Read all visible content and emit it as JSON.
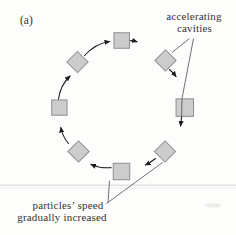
{
  "figure": {
    "panel_label": "(a)",
    "caption_top_right": {
      "line1": "accelerating",
      "line2": "cavities"
    },
    "caption_bottom_left": {
      "line1": "particles’ speed",
      "line2": "gradually increased"
    },
    "colors": {
      "background": "#fdfdfc",
      "cavity_fill": "#cccccc",
      "cavity_border": "#8e8e8e",
      "arrow": "#1c1c1c",
      "pointer": "#4d4d4d",
      "text": "#333333",
      "scan_rule": "#e4e4e4",
      "scan_rule_light": "#f1f1f0",
      "smudge": "#ececea"
    },
    "cavities": [
      {
        "name": "cavity-top",
        "cx": 121.7,
        "cy": 40.5,
        "size": 15.5,
        "rot": 0
      },
      {
        "name": "cavity-top-right",
        "cx": 165.5,
        "cy": 60.5,
        "size": 15,
        "rot": 45
      },
      {
        "name": "cavity-right",
        "cx": 184.8,
        "cy": 107.6,
        "size": 17.5,
        "rot": 0
      },
      {
        "name": "cavity-bottom-right",
        "cx": 165,
        "cy": 151.5,
        "size": 15,
        "rot": 45
      },
      {
        "name": "cavity-bottom",
        "cx": 121.5,
        "cy": 171.5,
        "size": 16.5,
        "rot": 0
      },
      {
        "name": "cavity-bottom-left",
        "cx": 78.5,
        "cy": 151.5,
        "size": 15,
        "rot": 45
      },
      {
        "name": "cavity-left",
        "cx": 59.4,
        "cy": 107.6,
        "size": 15.3,
        "rot": 0
      },
      {
        "name": "cavity-top-left",
        "cx": 77.5,
        "cy": 62,
        "size": 15,
        "rot": 45
      }
    ],
    "motion_arrows": [
      {
        "name": "motion-arrow-topleft-to-top",
        "path": "M84.5,55.5 Q95.5,43.5 109.5,41.5"
      },
      {
        "name": "motion-arrow-top-exit",
        "path": "M130.5,40.6 Q134,40.9 137,41.8"
      },
      {
        "name": "motion-arrow-topright-exit",
        "path": "M169.5,69.5 Q173,72.5 176,76.5"
      },
      {
        "name": "motion-arrow-right-exit",
        "path": "M181.6,117 Q181,122 180.6,126"
      },
      {
        "name": "motion-arrow-bottomright-to-bottom",
        "path": "M155.5,158.5 Q150.5,162.5 145.5,165"
      },
      {
        "name": "motion-arrow-bottom-exit",
        "path": "M111,167.6 Q100.5,168.6 91,164.4"
      },
      {
        "name": "motion-arrow-bottomleft-to-left",
        "path": "M68.5,143.5 Q62.5,136.5 60.8,127.5"
      },
      {
        "name": "motion-arrow-left-to-topleft",
        "path": "M58.5,99 Q60.5,85 70,76"
      }
    ],
    "pointer_lines": [
      {
        "name": "pointer-cavities-to-diamond",
        "path": "M189.5,38.5 L172,52.5"
      },
      {
        "name": "pointer-cavities-to-square",
        "path": "M193.5,38.5 L182,98.5 L181.6,117"
      },
      {
        "name": "pointer-speed-to-bottom-square",
        "path": "M108,202.5 L109.5,180.5"
      },
      {
        "name": "pointer-speed-to-diamond",
        "path": "M106.5,203.5 L162.5,162.5"
      }
    ]
  }
}
